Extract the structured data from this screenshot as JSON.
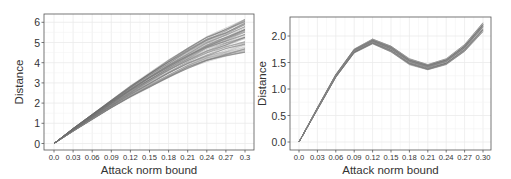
{
  "chart_data": [
    {
      "type": "line",
      "title": "",
      "xlabel": "Attack norm bound",
      "ylabel": "Distance",
      "x_ticks": [
        "0.0",
        "0.03",
        "0.06",
        "0.09",
        "0.12",
        "0.15",
        "0.18",
        "0.21",
        "0.24",
        "0.27",
        "0.3"
      ],
      "y_ticks": [
        "0",
        "1",
        "2",
        "3",
        "4",
        "5",
        "6"
      ],
      "xlim": [
        0.0,
        0.3
      ],
      "ylim": [
        0,
        6.3
      ],
      "grid": true,
      "legend": null,
      "x": [
        0.0,
        0.03,
        0.06,
        0.09,
        0.12,
        0.15,
        0.18,
        0.21,
        0.24,
        0.27,
        0.3
      ],
      "series_description": "Many overlapping gray lines (bundle) growing roughly linearly from 0; spread widens with x",
      "series": [
        {
          "name": "upper-envelope",
          "values": [
            0.0,
            0.75,
            1.45,
            2.15,
            2.85,
            3.5,
            4.15,
            4.75,
            5.3,
            5.7,
            6.2
          ]
        },
        {
          "name": "mean",
          "values": [
            0.0,
            0.68,
            1.32,
            1.95,
            2.55,
            3.12,
            3.65,
            4.15,
            4.6,
            4.95,
            5.3
          ]
        },
        {
          "name": "lower-envelope",
          "values": [
            0.0,
            0.6,
            1.18,
            1.75,
            2.28,
            2.78,
            3.25,
            3.7,
            4.05,
            4.3,
            4.5
          ]
        }
      ]
    },
    {
      "type": "line",
      "title": "",
      "xlabel": "Attack norm bound",
      "ylabel": "Distance",
      "x_ticks": [
        "0.0",
        "0.03",
        "0.06",
        "0.09",
        "0.12",
        "0.15",
        "0.18",
        "0.21",
        "0.24",
        "0.27",
        "0.30"
      ],
      "y_ticks": [
        "0.0",
        "0.5",
        "1.0",
        "1.5",
        "2.0"
      ],
      "xlim": [
        0.0,
        0.3
      ],
      "ylim": [
        -0.05,
        2.3
      ],
      "grid": true,
      "legend": null,
      "x": [
        0.0,
        0.03,
        0.06,
        0.09,
        0.12,
        0.15,
        0.18,
        0.21,
        0.24,
        0.27,
        0.3
      ],
      "series_description": "Narrow bundle of gray lines: rise to peak ~1.9 at 0.12, dip to ~1.42 at 0.21, rise to ~2.2 at 0.30",
      "series": [
        {
          "name": "upper-envelope",
          "values": [
            0.0,
            0.65,
            1.28,
            1.76,
            1.95,
            1.82,
            1.58,
            1.47,
            1.58,
            1.85,
            2.27
          ]
        },
        {
          "name": "mean",
          "values": [
            0.0,
            0.63,
            1.25,
            1.72,
            1.9,
            1.76,
            1.52,
            1.42,
            1.52,
            1.78,
            2.18
          ]
        },
        {
          "name": "lower-envelope",
          "values": [
            0.0,
            0.61,
            1.22,
            1.68,
            1.85,
            1.7,
            1.46,
            1.36,
            1.46,
            1.71,
            2.08
          ]
        }
      ]
    }
  ]
}
